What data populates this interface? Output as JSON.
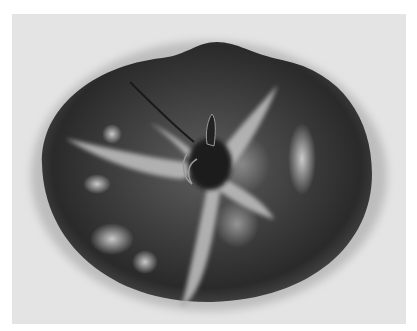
{
  "image": {
    "subject": "tomato",
    "view": "top view showing stem and calyx",
    "color_mode": "grayscale",
    "alt": "Black and white photograph of a tomato seen from above, with a dried star-shaped calyx and stem at the center and pale blotches on the skin"
  },
  "colors": {
    "background": "#e4e4e4",
    "margin": "#ffffff",
    "fruit_dark": "#2a2a2a",
    "fruit_mid": "#555555",
    "highlight": "#c8c8c8",
    "calyx": "#b5b5b5"
  }
}
